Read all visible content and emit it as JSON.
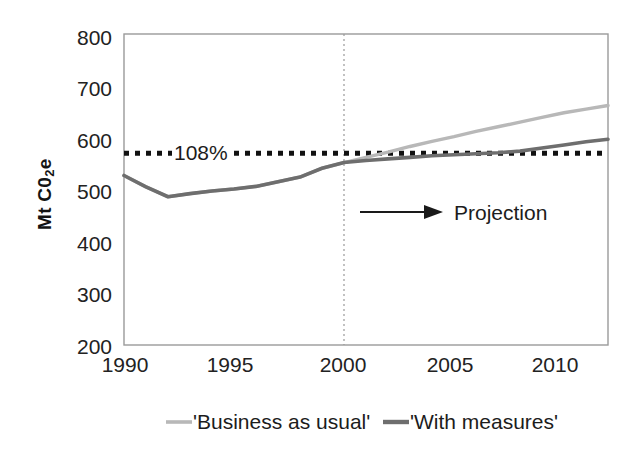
{
  "chart_data": {
    "type": "line",
    "title": "",
    "xlabel": "",
    "ylabel": "Mt C0",
    "ylabel_sub": "2",
    "ylabel_tail": "e",
    "xlim": [
      1990,
      2012
    ],
    "ylim": [
      200,
      800
    ],
    "grid": false,
    "legend_position": "bottom",
    "yticks": [
      800,
      700,
      600,
      500,
      400,
      300,
      200
    ],
    "xticks": [
      1990,
      1995,
      2000,
      2005,
      2010
    ],
    "x": [
      1990,
      1991,
      1992,
      1993,
      1994,
      1995,
      1996,
      1997,
      1998,
      1999,
      2000,
      2001,
      2002,
      2003,
      2004,
      2005,
      2006,
      2007,
      2008,
      2009,
      2010,
      2011,
      2012
    ],
    "series": [
      {
        "name": "'Business as usual'",
        "color": "#b8b8b8",
        "values": [
          527,
          505,
          486,
          492,
          497,
          501,
          506,
          515,
          524,
          541,
          552,
          562,
          572,
          583,
          593,
          602,
          612,
          621,
          630,
          639,
          648,
          655,
          662
        ]
      },
      {
        "name": "'With measures'",
        "color": "#6e6e6e",
        "values": [
          527,
          505,
          486,
          492,
          497,
          501,
          506,
          515,
          524,
          541,
          552,
          556,
          559,
          562,
          565,
          567,
          569,
          571,
          574,
          580,
          586,
          592,
          597
        ]
      }
    ],
    "reference_line": {
      "label": "108%",
      "value": 570,
      "style": "dotted",
      "color": "#111111"
    },
    "divider_line": {
      "x": 2000,
      "style": "dotted",
      "color": "#999999"
    },
    "annotations": [
      {
        "name": "projection-arrow",
        "label": "Projection",
        "arrow": true
      }
    ]
  },
  "legend": {
    "items": [
      {
        "label": "'Business as usual'",
        "color": "#b8b8b8"
      },
      {
        "label": "'With measures'",
        "color": "#6e6e6e"
      }
    ]
  },
  "axis": {
    "y_ticks": [
      "800",
      "700",
      "600",
      "500",
      "400",
      "300",
      "200"
    ],
    "x_ticks": [
      "1990",
      "1995",
      "2000",
      "2005",
      "2010"
    ],
    "y_title_main": "Mt C0",
    "y_title_sub": "2",
    "y_title_end": "e"
  },
  "annotations": {
    "reference_label": "108%",
    "projection_label": "Projection"
  }
}
